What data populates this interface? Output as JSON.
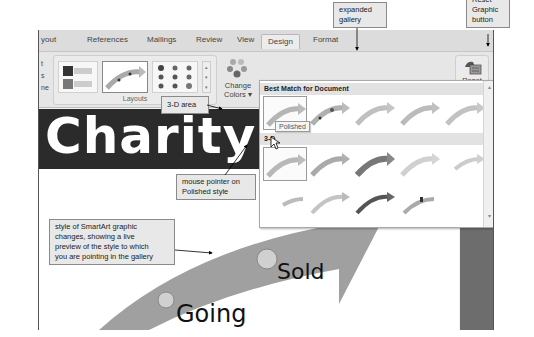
{
  "tabs": [
    {
      "label": "yout"
    },
    {
      "label": "References"
    },
    {
      "label": "Mailings"
    },
    {
      "label": "Review"
    },
    {
      "label": "View"
    },
    {
      "label": "Design",
      "active": true
    },
    {
      "label": "Format"
    }
  ],
  "ribbon": {
    "left_partial_labels": [
      "t",
      "s",
      "ne"
    ],
    "layouts_group_label": "Layouts",
    "change_colors_label_1": "Change",
    "change_colors_label_2": "Colors ▾",
    "reset_graphic_label_1": "Reset",
    "reset_graphic_label_2": "Graphic",
    "reset_group_label": "Reset"
  },
  "gallery": {
    "section_best_match": "Best Match for Document",
    "section_3d": "3-D",
    "tooltip": "Polished",
    "scroll_up": "▴",
    "scroll_down": "▾"
  },
  "document": {
    "title_text": "Charity·A",
    "smartart_label_1": "Sold",
    "smartart_label_2": "Going"
  },
  "callouts": {
    "expanded_gallery": [
      "expanded",
      "gallery"
    ],
    "reset_graphic_button": [
      "Reset",
      "Graphic",
      "button"
    ],
    "three_d_area": "3-D area",
    "mouse_pointer": [
      "mouse pointer on",
      "Polished style"
    ],
    "live_preview": [
      "style of SmartArt graphic",
      "changes, showing a live",
      "preview of the style to which",
      "you are pointing in the gallery"
    ]
  },
  "colors": {
    "title_band": "#2b2b2b",
    "callout_bg": "#e8e8e8",
    "arrow_gray": "#9a9a9a"
  }
}
